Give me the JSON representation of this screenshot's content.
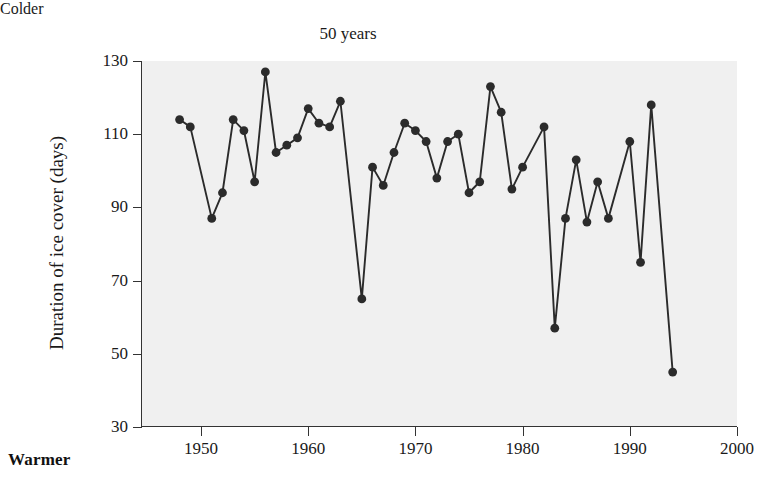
{
  "figure": {
    "top_left_label": "Colder",
    "bottom_left_label": "Warmer"
  },
  "chart_data": {
    "type": "line",
    "title": "50 years",
    "xlabel": "",
    "ylabel": "Duration of ice cover (days)",
    "xlim": [
      1944.4,
      2000.0
    ],
    "ylim": [
      30,
      130
    ],
    "xticks": [
      1950,
      1960,
      1970,
      1980,
      1990,
      2000
    ],
    "xtick_labels": [
      "1950",
      "1960",
      "1970",
      "1980",
      "1990",
      "2000"
    ],
    "yticks": [
      30,
      50,
      70,
      90,
      110,
      130
    ],
    "ytick_labels": [
      "30",
      "50",
      "70",
      "90",
      "110",
      "130"
    ],
    "grid": false,
    "legend": "none",
    "marker": "filled-circle",
    "line_color": "#2b2b2b",
    "marker_color": "#2b2b2b",
    "plot_background": "#f0f0f0",
    "figure_background": "#ffffff",
    "annotations": [
      {
        "text": "Colder",
        "position": "above-top-left-of-axes"
      },
      {
        "text": "Warmer",
        "position": "below-bottom-left-of-axes"
      }
    ],
    "x": [
      1948,
      1949,
      1951,
      1952,
      1953,
      1954,
      1955,
      1956,
      1957,
      1958,
      1959,
      1960,
      1961,
      1962,
      1963,
      1964,
      1966,
      1967,
      1968,
      1969,
      1970,
      1971,
      1972,
      1973,
      1974,
      1975,
      1976,
      1977,
      1978,
      1979,
      1980,
      1981,
      1982,
      1983,
      1984,
      1985,
      1986,
      1987,
      1988,
      1989,
      1990,
      1991,
      1992,
      1993,
      1994,
      1996,
      1997,
      1999
    ],
    "y": [
      114,
      112,
      87,
      94,
      114,
      111,
      97,
      127,
      105,
      107,
      109,
      117,
      113,
      112,
      119,
      65,
      101,
      96,
      105,
      113,
      111,
      108,
      98,
      108,
      110,
      94,
      97,
      123,
      116,
      95,
      101,
      57,
      112,
      87,
      103,
      86,
      97,
      87,
      108,
      75,
      118,
      45,
      0,
      0,
      0,
      0,
      0,
      0
    ],
    "series": [
      {
        "name": "Duration of ice cover",
        "points": [
          [
            1948,
            114
          ],
          [
            1949,
            112
          ],
          [
            1951,
            87
          ],
          [
            1952,
            94
          ],
          [
            1953,
            114
          ],
          [
            1954,
            111
          ],
          [
            1955,
            97
          ],
          [
            1956,
            127
          ],
          [
            1957,
            105
          ],
          [
            1958,
            107
          ],
          [
            1959,
            109
          ],
          [
            1960,
            117
          ],
          [
            1961,
            113
          ],
          [
            1962,
            112
          ],
          [
            1963,
            119
          ],
          [
            1965,
            65
          ],
          [
            1966,
            101
          ],
          [
            1967,
            96
          ],
          [
            1968,
            105
          ],
          [
            1969,
            113
          ],
          [
            1970,
            111
          ],
          [
            1971,
            108
          ],
          [
            1972,
            98
          ],
          [
            1973,
            108
          ],
          [
            1974,
            110
          ],
          [
            1975,
            94
          ],
          [
            1976,
            97
          ],
          [
            1977,
            123
          ],
          [
            1978,
            116
          ],
          [
            1979,
            95
          ],
          [
            1980,
            101
          ],
          [
            1982,
            112
          ],
          [
            1983,
            57
          ],
          [
            1984,
            87
          ],
          [
            1985,
            103
          ],
          [
            1986,
            86
          ],
          [
            1987,
            97
          ],
          [
            1988,
            87
          ],
          [
            1990,
            108
          ],
          [
            1991,
            75
          ],
          [
            1992,
            118
          ],
          [
            1994,
            45
          ]
        ]
      }
    ]
  }
}
